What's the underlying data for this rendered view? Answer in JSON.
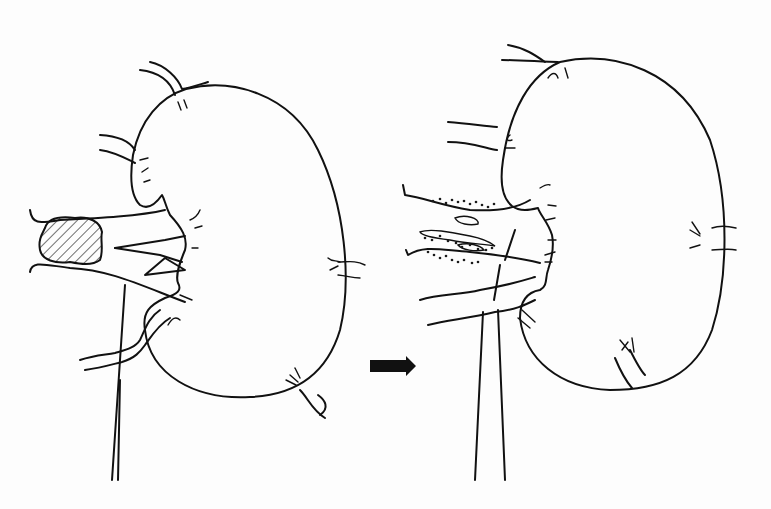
{
  "figure": {
    "width": 771,
    "height": 509,
    "background": "#fdfdfd",
    "ink_color": "#111111",
    "panels": [
      {
        "id": "before",
        "description": "kidney with hatched stone/mass in renal hilum",
        "outline": "M186,89 C230,78 290,92 318,150 C345,205 352,280 340,330 C328,370 300,395 250,397 C195,400 150,375 145,330 C142,312 150,305 165,298 C178,294 182,290 178,283 C175,275 180,262 185,250 C188,238 182,228 170,215 C165,205 165,200 162,195 C155,205 148,210 140,205 C130,195 130,175 133,155 C140,120 160,97 186,89 Z",
        "vessels": [
          "M30,210 C32,225 40,223 60,220 C100,218 140,216 165,210",
          "M30,272 C32,260 45,265 70,268 C110,270 140,285 185,302",
          "M115,248 L165,240 L185,236",
          "M115,248 L160,255 L182,262",
          "M145,275 L165,258 L185,270 Z",
          "M125,285 L112,480",
          "M120,380 L118,480",
          "M80,360 C95,355 105,355 115,353 C125,350 135,348 140,340 C145,330 148,318 160,310",
          "M85,370 C100,368 110,365 122,362 C135,358 140,352 145,345 C150,338 158,325 170,318",
          "M140,70 C158,72 170,80 175,95",
          "M150,62 C165,65 178,78 182,89 C190,88 198,85 208,82",
          "M100,135 C118,136 130,142 135,150",
          "M100,150 C115,152 125,158 135,163",
          "M318,395 C325,400 330,408 320,415",
          "M300,390 C308,398 312,410 325,418"
        ],
        "capsule_marks": [
          "M178,102 L181,110",
          "M184,100 L187,108",
          "M140,160 L148,158",
          "M142,172 L148,168",
          "M144,182 L150,180",
          "M190,220 C195,218 198,215 200,210",
          "M195,228 L202,226",
          "M192,248 L198,248",
          "M180,295 L192,300",
          "M168,325 C172,318 176,316 180,320",
          "M328,258 C332,262 336,260 340,262",
          "M330,270 L338,266",
          "M290,375 L298,382",
          "M295,368 L300,378",
          "M286,380 L296,385",
          "M338,262 C348,262 355,260 365,265",
          "M338,275 C348,276 352,278 360,278"
        ],
        "mass": {
          "shape": "M45,228 C48,218 60,216 75,218 C90,216 100,222 102,232 C100,240 104,250 100,260 C92,266 80,264 70,262 C55,264 42,260 40,250 C38,240 42,234 45,228 Z",
          "hatched": true
        }
      },
      {
        "id": "after",
        "description": "kidney after treatment with fragmented/dotted vessels at hilum",
        "outline": "M560,62 C615,50 680,70 710,140 C730,200 728,280 712,330 C695,375 660,390 610,390 C560,388 525,360 520,318 C520,300 528,292 540,290 C548,286 545,278 548,270 C552,258 554,245 552,235 C548,222 540,215 538,208 C530,210 520,212 512,206 C502,198 500,180 503,160 C510,110 530,75 560,62 Z",
        "vessels": [
          "M508,45 C525,48 535,55 545,62",
          "M502,60 C520,60 545,62 558,62",
          "M448,122 C470,124 485,126 497,127",
          "M448,142 C470,142 485,148 497,150",
          "M403,185 L405,195 C425,198 440,205 470,210 C505,212 522,205 530,200",
          "M406,250 L408,255 C425,245 440,250 470,252 C500,255 520,258 540,263",
          "M420,300 C440,294 460,295 480,290 C510,285 525,280 535,277",
          "M428,325 C450,320 470,318 495,312 C515,310 525,305 535,300",
          "M483,312 L475,480",
          "M498,310 L505,480",
          "M515,230 L505,260",
          "M494,300 L500,265",
          "M630,350 C635,360 640,370 645,375",
          "M615,358 C620,370 625,380 632,388"
        ],
        "fragments": [
          "M455,218 C465,214 480,218 478,224 C470,226 458,224 455,218 Z",
          "M420,232 C430,228 450,232 470,236 C480,238 490,242 495,246 C485,244 470,244 450,240 C435,238 422,236 420,232 Z",
          "M458,245 C468,242 480,245 484,250 C475,252 462,250 458,245 Z"
        ],
        "dots": [
          [
            433,
            201
          ],
          [
            440,
            199
          ],
          [
            446,
            203
          ],
          [
            452,
            200
          ],
          [
            458,
            202
          ],
          [
            464,
            201
          ],
          [
            470,
            204
          ],
          [
            476,
            202
          ],
          [
            482,
            205
          ],
          [
            488,
            207
          ],
          [
            494,
            204
          ],
          [
            425,
            238
          ],
          [
            432,
            240
          ],
          [
            440,
            236
          ],
          [
            448,
            241
          ],
          [
            456,
            243
          ],
          [
            462,
            247
          ],
          [
            470,
            245
          ],
          [
            478,
            249
          ],
          [
            486,
            250
          ],
          [
            492,
            248
          ],
          [
            428,
            252
          ],
          [
            434,
            255
          ],
          [
            440,
            258
          ],
          [
            446,
            256
          ],
          [
            452,
            260
          ],
          [
            458,
            262
          ],
          [
            464,
            260
          ],
          [
            472,
            263
          ],
          [
            478,
            262
          ]
        ],
        "capsule_marks": [
          "M548,78 C552,72 556,72 558,78",
          "M565,68 L568,78",
          "M510,135 C506,138 506,142 512,140",
          "M505,148 L515,148",
          "M540,188 C545,185 548,184 550,185",
          "M548,205 L556,206",
          "M546,220 L555,218",
          "M548,240 L556,240",
          "M545,255 L555,252",
          "M545,262 L552,262",
          "M522,310 L535,322",
          "M518,318 L530,328",
          "M692,222 L700,234",
          "M690,230 L700,236",
          "M690,248 L700,245",
          "M712,228 C720,225 728,226 736,228",
          "M712,250 C720,250 728,248 736,250",
          "M620,340 L630,352",
          "M622,350 L628,342",
          "M632,338 L634,352"
        ]
      }
    ],
    "arrow": {
      "label": "transition-arrow",
      "x": 370,
      "y": 357,
      "width": 46,
      "height": 18,
      "color": "#111111"
    }
  }
}
